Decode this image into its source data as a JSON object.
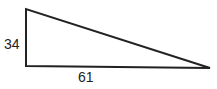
{
  "diagram": {
    "type": "right-triangle",
    "labels": {
      "vertical_side": "34",
      "horizontal_side": "61"
    },
    "colors": {
      "stroke": "#222222",
      "background": "#ffffff"
    }
  }
}
